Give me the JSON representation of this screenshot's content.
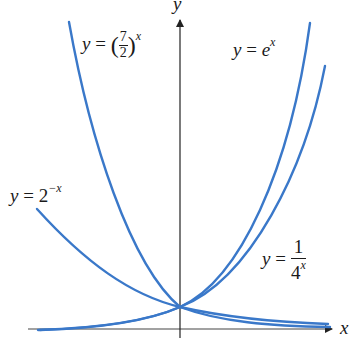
{
  "figure": {
    "type": "exponential-function-graphs",
    "axes": {
      "x_label": "x",
      "y_label": "y",
      "axis_color": "#222222"
    },
    "curve_color": "#3a78c9",
    "labels": {
      "seven_halves": {
        "lhs": "y",
        "eq": "=",
        "num": "7",
        "den": "2",
        "exp": "x"
      },
      "e_x": {
        "lhs": "y",
        "eq": "=",
        "base": "e",
        "exp": "x"
      },
      "two_neg_x": {
        "lhs": "y",
        "eq": "=",
        "base": "2",
        "exp": "−x"
      },
      "one_over_four_x": {
        "lhs": "y",
        "eq": "=",
        "num": "1",
        "den_base": "4",
        "den_exp": "x"
      }
    },
    "curves": [
      {
        "name": "(7/2)^x",
        "description": "steep curve rising to the upper left, crossing (0,1)"
      },
      {
        "name": "e^x",
        "description": "rises steeply to the upper right through (0,1)"
      },
      {
        "name": "2^-x",
        "description": "decreasing curve from upper left through (0,1)"
      },
      {
        "name": "1/4^x",
        "description": "curve labeled on right, through (0,1)"
      }
    ],
    "intersection_point": "(0, 1)"
  }
}
